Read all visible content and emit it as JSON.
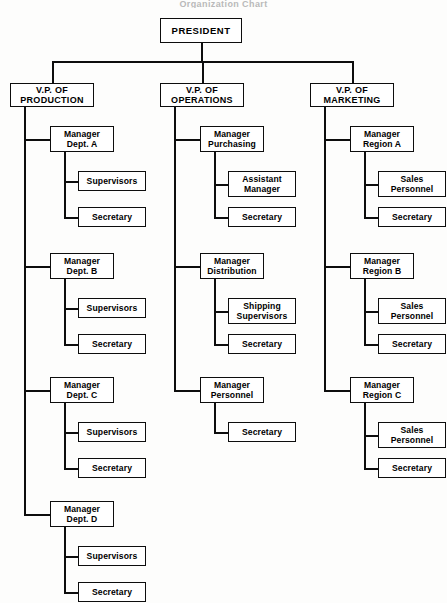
{
  "document": {
    "type": "organization-chart",
    "title_remnant": "Organization Chart",
    "orientation": "vertical-hierarchy",
    "columns": 3,
    "line_color": "#0d0d0d",
    "box_fill": "#ffffff",
    "page_background": "#fdfdfc"
  },
  "root": {
    "label": "PRESIDENT",
    "level": "president"
  },
  "divisions": [
    {
      "id": "production",
      "vp_label_line1": "V.P. OF",
      "vp_label_line2": "PRODUCTION",
      "managers": [
        {
          "id": "dept-a",
          "label_line1": "Manager",
          "label_line2": "Dept. A",
          "reports": [
            {
              "id": "supervisors-a",
              "label_line1": "Supervisors",
              "label_line2": ""
            },
            {
              "id": "secretary-a",
              "label_line1": "Secretary",
              "label_line2": ""
            }
          ]
        },
        {
          "id": "dept-b",
          "label_line1": "Manager",
          "label_line2": "Dept. B",
          "reports": [
            {
              "id": "supervisors-b",
              "label_line1": "Supervisors",
              "label_line2": ""
            },
            {
              "id": "secretary-b",
              "label_line1": "Secretary",
              "label_line2": ""
            }
          ]
        },
        {
          "id": "dept-c",
          "label_line1": "Manager",
          "label_line2": "Dept. C",
          "reports": [
            {
              "id": "supervisors-c",
              "label_line1": "Supervisors",
              "label_line2": ""
            },
            {
              "id": "secretary-c",
              "label_line1": "Secretary",
              "label_line2": ""
            }
          ]
        },
        {
          "id": "dept-d",
          "label_line1": "Manager",
          "label_line2": "Dept. D",
          "reports": [
            {
              "id": "supervisors-d",
              "label_line1": "Supervisors",
              "label_line2": ""
            },
            {
              "id": "secretary-d",
              "label_line1": "Secretary",
              "label_line2": ""
            }
          ]
        }
      ]
    },
    {
      "id": "operations",
      "vp_label_line1": "V.P. OF",
      "vp_label_line2": "OPERATIONS",
      "managers": [
        {
          "id": "purchasing",
          "label_line1": "Manager",
          "label_line2": "Purchasing",
          "reports": [
            {
              "id": "assistant-manager",
              "label_line1": "Assistant",
              "label_line2": "Manager"
            },
            {
              "id": "secretary-purchasing",
              "label_line1": "Secretary",
              "label_line2": ""
            }
          ]
        },
        {
          "id": "distribution",
          "label_line1": "Manager",
          "label_line2": "Distribution",
          "reports": [
            {
              "id": "shipping-supervisors",
              "label_line1": "Shipping",
              "label_line2": "Supervisors"
            },
            {
              "id": "secretary-distribution",
              "label_line1": "Secretary",
              "label_line2": ""
            }
          ]
        },
        {
          "id": "personnel",
          "label_line1": "Manager",
          "label_line2": "Personnel",
          "reports": [
            {
              "id": "secretary-personnel",
              "label_line1": "Secretary",
              "label_line2": ""
            }
          ]
        }
      ]
    },
    {
      "id": "marketing",
      "vp_label_line1": "V.P. OF",
      "vp_label_line2": "MARKETING",
      "managers": [
        {
          "id": "region-a",
          "label_line1": "Manager",
          "label_line2": "Region A",
          "reports": [
            {
              "id": "sales-personnel-a",
              "label_line1": "Sales",
              "label_line2": "Personnel"
            },
            {
              "id": "secretary-region-a",
              "label_line1": "Secretary",
              "label_line2": ""
            }
          ]
        },
        {
          "id": "region-b",
          "label_line1": "Manager",
          "label_line2": "Region B",
          "reports": [
            {
              "id": "sales-personnel-b",
              "label_line1": "Sales",
              "label_line2": "Personnel"
            },
            {
              "id": "secretary-region-b",
              "label_line1": "Secretary",
              "label_line2": ""
            }
          ]
        },
        {
          "id": "region-c",
          "label_line1": "Manager",
          "label_line2": "Region C",
          "reports": [
            {
              "id": "sales-personnel-c",
              "label_line1": "Sales",
              "label_line2": "Personnel"
            },
            {
              "id": "secretary-region-c",
              "label_line1": "Secretary",
              "label_line2": ""
            }
          ]
        }
      ]
    }
  ],
  "geometry": {
    "canvas_width": 447,
    "canvas_height": 603,
    "president": {
      "x": 160,
      "y": 18,
      "w": 82,
      "h": 25
    },
    "bus_y": 61,
    "vp": {
      "y": 83,
      "w": 84,
      "h": 24
    },
    "column_x": [
      10,
      160,
      310
    ],
    "vp_spine_offset": 14,
    "manager": {
      "x_offset": 40,
      "w": 64,
      "h": 26
    },
    "manager_spine_offset": 54,
    "leaf": {
      "x_offset": 68,
      "w": 68,
      "h": 20,
      "h_two_line": 26
    },
    "manager_rows_y": [
      126,
      253,
      377,
      501
    ],
    "child_offsets_y": [
      45,
      81
    ]
  }
}
